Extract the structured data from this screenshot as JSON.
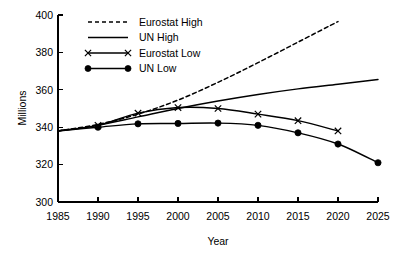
{
  "chart_data": {
    "type": "line",
    "title": "",
    "xlabel": "Year",
    "ylabel": "Millions",
    "xlim": [
      1985,
      2025
    ],
    "ylim": [
      300,
      400
    ],
    "xticks": [
      1985,
      1990,
      1995,
      2000,
      2005,
      2010,
      2015,
      2020,
      2025
    ],
    "yticks": [
      300,
      320,
      340,
      360,
      380,
      400
    ],
    "grid": false,
    "legend_position": "top-left-inside",
    "series": [
      {
        "name": "Eurostat High",
        "style": "dashed",
        "marker": "none",
        "x": [
          1985,
          1990,
          1995,
          2000,
          2005,
          2010,
          2015,
          2020
        ],
        "values": [
          338.0,
          341.5,
          347.0,
          354.5,
          364.0,
          374.5,
          385.5,
          396.5
        ]
      },
      {
        "name": "UN High",
        "style": "solid",
        "marker": "none",
        "x": [
          1985,
          1990,
          1995,
          2000,
          2005,
          2010,
          2015,
          2020,
          2025
        ],
        "values": [
          338.0,
          341.0,
          345.5,
          350.0,
          354.0,
          357.5,
          360.5,
          363.0,
          365.5
        ]
      },
      {
        "name": "Eurostat Low",
        "style": "solid",
        "marker": "x",
        "x": [
          1990,
          1995,
          2000,
          2005,
          2010,
          2015,
          2020
        ],
        "values": [
          341.0,
          347.5,
          350.5,
          350.0,
          347.0,
          343.5,
          338.0
        ]
      },
      {
        "name": "UN Low",
        "style": "solid",
        "marker": "dot",
        "x": [
          1990,
          1995,
          2000,
          2005,
          2010,
          2015,
          2020,
          2025
        ],
        "values": [
          340.0,
          341.8,
          342.0,
          342.2,
          341.0,
          337.0,
          331.0,
          321.0
        ]
      }
    ],
    "series_origin_note": "all series begin at 338.0 in 1985"
  },
  "legend": {
    "entries": [
      {
        "label": "Eurostat High"
      },
      {
        "label": "UN High"
      },
      {
        "label": "Eurostat Low"
      },
      {
        "label": "UN Low"
      }
    ]
  },
  "axes": {
    "x_title": "Year",
    "y_title": "Millions",
    "x_tick_labels": [
      "1985",
      "1990",
      "1995",
      "2000",
      "2005",
      "2010",
      "2015",
      "2020",
      "2025"
    ],
    "y_tick_labels": [
      "300",
      "320",
      "340",
      "360",
      "380",
      "400"
    ]
  },
  "colors": {
    "line": "#000000",
    "axis": "#000000",
    "background": "#ffffff"
  }
}
